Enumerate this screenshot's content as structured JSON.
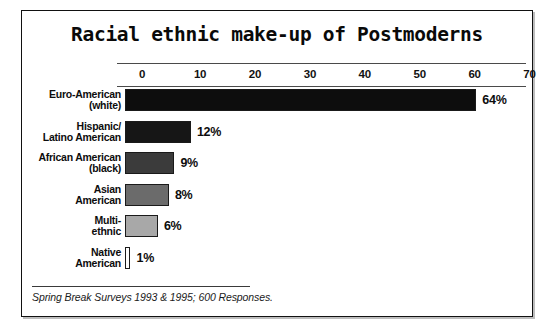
{
  "chart_data": {
    "type": "bar",
    "orientation": "horizontal",
    "title": "Racial ethnic make-up of Postmoderns",
    "xlabel": "",
    "ylabel": "",
    "xlim": [
      0,
      70
    ],
    "grid": false,
    "legend": null,
    "categories": [
      "Euro-American\n(white)",
      "Hispanic/\nLatino American",
      "African American\n(black)",
      "Asian\nAmerican",
      "Multi-\nethnic",
      "Native\nAmerican"
    ],
    "values": [
      64,
      12,
      9,
      8,
      6,
      1
    ],
    "data_labels": [
      "64%",
      "12%",
      "9%",
      "8%",
      "6%",
      "1%"
    ],
    "bar_colors": [
      "#0d0d0d",
      "#161616",
      "#3b3b3b",
      "#6b6b6b",
      "#a8a8a8",
      "#fdfdfd"
    ],
    "tick_labels": [
      "0",
      "10",
      "20",
      "30",
      "40",
      "50",
      "60",
      "70"
    ],
    "tick_values": [
      0,
      10,
      20,
      30,
      40,
      50,
      60,
      70
    ],
    "source_note": "Spring Break Surveys 1993 & 1995; 600 Responses."
  },
  "frame": {
    "border_color": "#111111"
  }
}
